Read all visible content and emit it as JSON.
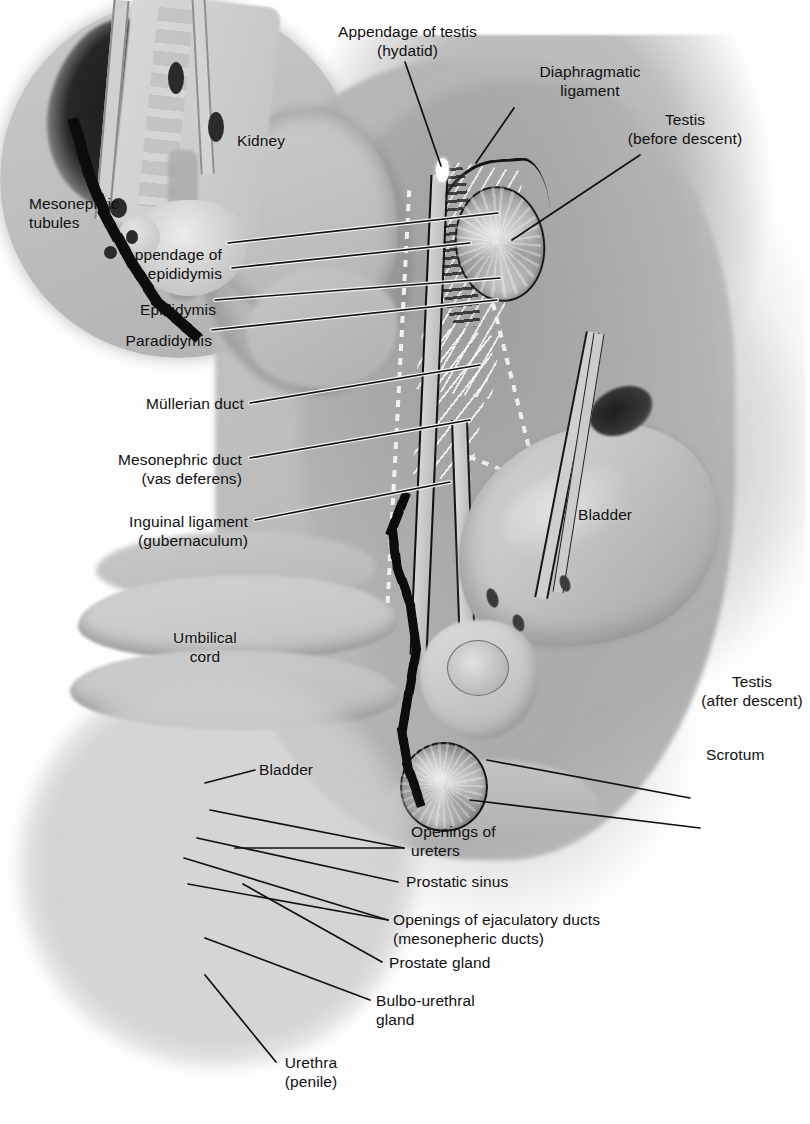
{
  "figure": {
    "type": "anatomical-illustration",
    "background_color": "#ffffff",
    "ink_color": "#101010"
  },
  "labels": {
    "appendage_of_testis": "Appendage of testis\n(hydatid)",
    "diaphragmatic_ligament": "Diaphragmatic\nligament",
    "testis_before_descent": "Testis\n(before descent)",
    "kidney": "Kidney",
    "mesonephric_tubules": "Mesonephric\ntubules",
    "appendage_of_epididymis": "Appendage of\nepididymis",
    "epididymis": "Epididymis",
    "paradidymis": "Paradidymis",
    "mullerian_duct": "Müllerian duct",
    "mesonephric_duct": "Mesonephric duct\n(vas deferens)",
    "inguinal_ligament": "Inguinal ligament\n(gubernaculum)",
    "umbilical_cord": "Umbilical\ncord",
    "bladder_main": "Bladder",
    "bladder_inset": "Bladder",
    "testis_after_descent": "Testis\n(after descent)",
    "scrotum": "Scrotum",
    "openings_of_ureters": "Openings of\n    ureters",
    "prostatic_sinus": "Prostatic sinus",
    "openings_of_ejaculatory_ducts": "Openings of ejaculatory ducts\n     (mesonepheric ducts)",
    "prostate_gland": "Prostate gland",
    "bulbo_urethral_gland": "Bulbo-urethral\n    gland",
    "urethra_penile": "Urethra\n(penile)"
  }
}
